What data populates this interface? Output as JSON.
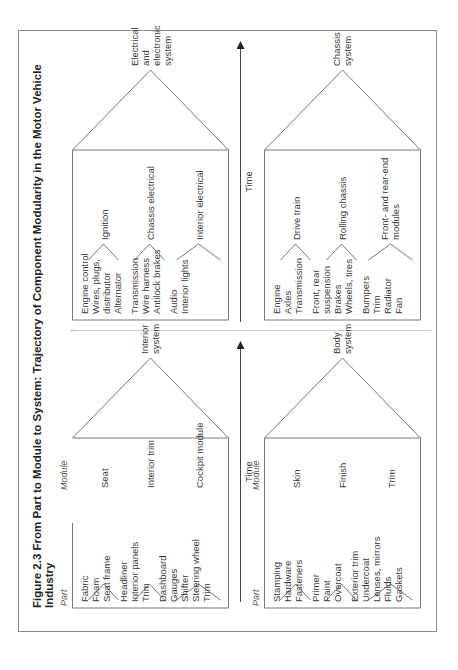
{
  "figure": {
    "title": "Figure 2.3 From Part to Module to System: Trajectory of Component Modularity in the Motor Vehicle Industry",
    "axis_label": "Time",
    "column_labels": {
      "part": "Part",
      "module": "Module"
    }
  },
  "quadrants": [
    {
      "id": "interior",
      "system": [
        "Interior",
        "system"
      ],
      "modules": [
        {
          "name": "Seat",
          "parts": [
            "Fabric",
            "Foam",
            "Seat frame"
          ]
        },
        {
          "name": "Interior trim",
          "parts": [
            "Headliner",
            "Interior panels",
            "Trim"
          ]
        },
        {
          "name": "Cockpit module",
          "parts": [
            "Dashboard",
            "Gauges",
            "Shifter",
            "Steering wheel",
            "Trim"
          ]
        }
      ]
    },
    {
      "id": "electrical",
      "system": [
        "Electrical",
        "and",
        "electronic",
        "system"
      ],
      "modules": [
        {
          "name": "Ignition",
          "parts": [
            "Engine control",
            "Wires, plugs,",
            "distributor",
            "Alternator"
          ]
        },
        {
          "name": "Chassis electrical",
          "parts": [
            "Transmission",
            "Wire harness",
            "Antilock brakes"
          ]
        },
        {
          "name": "Interior electrical",
          "parts": [
            "Audio",
            "Interior lights"
          ]
        }
      ]
    },
    {
      "id": "body",
      "system": [
        "Body",
        "system"
      ],
      "modules": [
        {
          "name": "Skin",
          "parts": [
            "Stamping",
            "Hardware",
            "Fasteners"
          ]
        },
        {
          "name": "Finish",
          "parts": [
            "Primer",
            "Paint",
            "Overcoat"
          ]
        },
        {
          "name": "Trim",
          "parts": [
            "Exterior trim",
            "Undercoat",
            "Lenses, mirrors",
            "Fluids",
            "Gaskets"
          ]
        }
      ]
    },
    {
      "id": "chassis",
      "system": [
        "Chassis",
        "system"
      ],
      "modules": [
        {
          "name": "Drive train",
          "parts": [
            "Engine",
            "Axles",
            "Transmission"
          ]
        },
        {
          "name": "Rolling chassis",
          "parts": [
            "Front, rear",
            "suspension",
            "Brakes",
            "Wheels, tires"
          ]
        },
        {
          "name": "Front- and rear-end modules",
          "parts": [
            "Bumpers",
            "Trim",
            "Radiator",
            "Fan"
          ]
        }
      ]
    }
  ]
}
